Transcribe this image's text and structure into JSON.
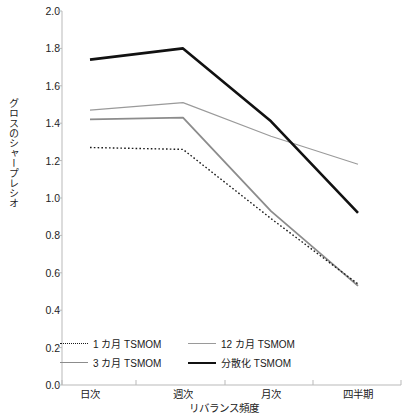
{
  "chart_data": {
    "type": "line",
    "title": "",
    "xlabel": "リバランス頻度",
    "ylabel": "グロスのシャープレシオ",
    "categories": [
      "日次",
      "週次",
      "月次",
      "四半期"
    ],
    "ylim": [
      0.0,
      2.0
    ],
    "yticks": [
      "0.0",
      "0.2",
      "0.4",
      "0.6",
      "0.8",
      "1.0",
      "1.2",
      "1.4",
      "1.6",
      "1.8",
      "2.0"
    ],
    "grid": false,
    "legend_position": "bottom-left-inside",
    "series": [
      {
        "name": "1 カ月 TSMOM",
        "style": "dotted",
        "color": "#1a1a1a",
        "width": 1.4,
        "values": [
          1.27,
          1.26,
          0.89,
          0.54
        ]
      },
      {
        "name": "3 カ月 TSMOM",
        "style": "solid",
        "color": "#8c8c8c",
        "width": 1.8,
        "values": [
          1.42,
          1.43,
          0.93,
          0.53
        ]
      },
      {
        "name": "12 カ月 TSMOM",
        "style": "solid",
        "color": "#9a9a9a",
        "width": 1.1,
        "values": [
          1.47,
          1.51,
          1.33,
          1.18
        ]
      },
      {
        "name": "分散化 TSMOM",
        "style": "solid",
        "color": "#111111",
        "width": 2.6,
        "values": [
          1.74,
          1.8,
          1.41,
          0.92
        ]
      }
    ]
  },
  "legend": {
    "items": [
      {
        "label": "1 カ月 TSMOM"
      },
      {
        "label": "12 カ月 TSMOM"
      },
      {
        "label": "3 カ月 TSMOM"
      },
      {
        "label": "分散化 TSMOM"
      }
    ]
  },
  "axes": {
    "color": "#b9b9b9"
  }
}
